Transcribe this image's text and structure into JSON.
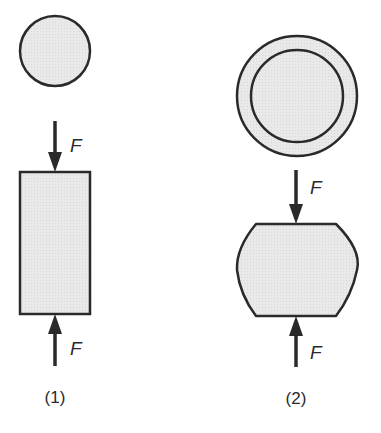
{
  "diagram": {
    "colors": {
      "fill": "#e6e6e6",
      "stroke": "#2a2a2a",
      "background": "#ffffff"
    },
    "figures": [
      {
        "id": "1",
        "caption": "(1)",
        "cross_section": "solid circle",
        "specimen": "straight cylinder (rectangle side view)",
        "forces": [
          {
            "label": "F",
            "direction": "down",
            "position": "top"
          },
          {
            "label": "F",
            "direction": "up",
            "position": "bottom"
          }
        ]
      },
      {
        "id": "2",
        "caption": "(2)",
        "cross_section": "circle with concentric inner ring",
        "specimen": "barreled cylinder (bulged sides)",
        "forces": [
          {
            "label": "F",
            "direction": "down",
            "position": "top"
          },
          {
            "label": "F",
            "direction": "up",
            "position": "bottom"
          }
        ]
      }
    ]
  }
}
